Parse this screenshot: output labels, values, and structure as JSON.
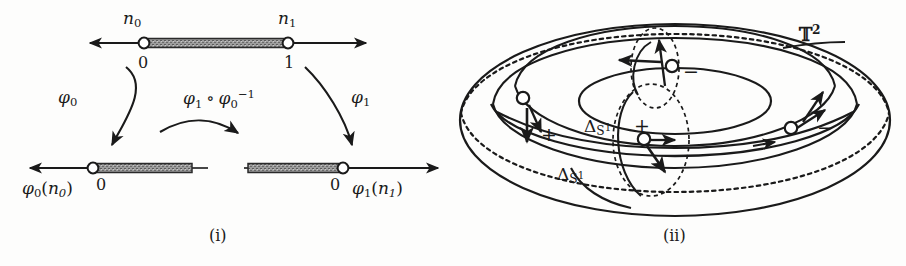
{
  "figure": {
    "panels": [
      {
        "id": "i",
        "caption": "(i)",
        "description": "Two charts of a 1-manifold with boundary and the transition map between them",
        "top_line": {
          "endpoint_labels": {
            "left": "n0",
            "right": "n1"
          },
          "node_values": {
            "left": "0",
            "right": "1"
          }
        },
        "bottom_left_line": {
          "node_value": "0",
          "label": "phi0(n0)"
        },
        "bottom_right_line": {
          "node_value": "0",
          "label": "phi1(n1)"
        },
        "maps": {
          "left": "phi0",
          "right": "phi1",
          "transition": "phi1 o phi0^-1"
        }
      },
      {
        "id": "ii",
        "caption": "(ii)",
        "description": "Torus with two transverse circle families, four marked intersection nodes with orientation signs",
        "surface_label": "T^2",
        "delta_labels": [
          "Delta_S1",
          "Delta_S1"
        ],
        "signs": [
          "-",
          "+",
          "+",
          "-"
        ]
      }
    ],
    "text": {
      "n0": "n",
      "n0_sub": "0",
      "n1": "n",
      "n1_sub": "1",
      "zero": "0",
      "one": "1",
      "phi": "φ",
      "zero_sub": "0",
      "one_sub": "1",
      "paren_open": "(",
      "paren_close": ")",
      "compose": "∘",
      "inverse_exp": "−1",
      "delta": "Δ",
      "S": "S",
      "sup_one": "1",
      "T": "𝕋",
      "sup_two": "2",
      "plus": "+",
      "minus": "−",
      "caption_i": "(i)",
      "caption_ii": "(ii)"
    },
    "colors": {
      "ink": "#1a1a1a",
      "band_fill": "#9a9a9a",
      "band_edge": "#2a2a2a",
      "node_fill": "#ffffff",
      "paper": "#fdfdfc"
    }
  }
}
